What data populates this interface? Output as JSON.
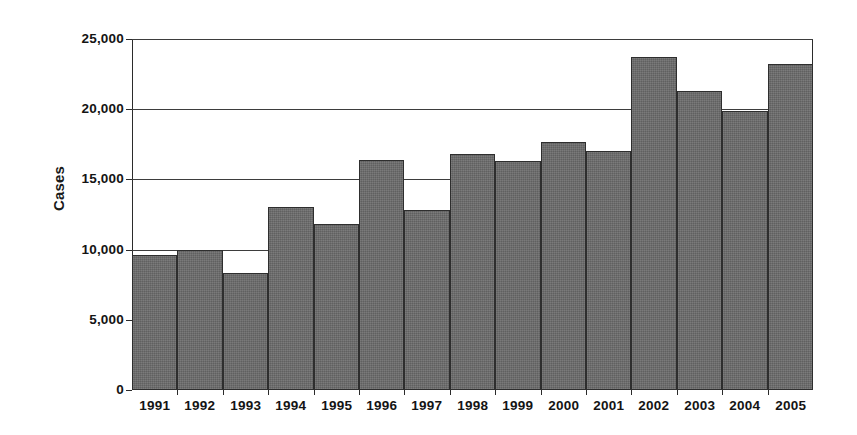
{
  "chart_data": {
    "type": "bar",
    "title": "",
    "subtitle": "",
    "xlabel": "",
    "ylabel": "Cases",
    "categories": [
      "1991",
      "1992",
      "1993",
      "1994",
      "1995",
      "1996",
      "1997",
      "1998",
      "1999",
      "2000",
      "2001",
      "2002",
      "2003",
      "2004",
      "2005"
    ],
    "values": [
      9600,
      10000,
      8300,
      13000,
      11800,
      16400,
      12850,
      16800,
      16300,
      17700,
      17000,
      23750,
      21300,
      19900,
      23250
    ],
    "series": [
      {
        "name": "Cases",
        "values": [
          9600,
          10000,
          8300,
          13000,
          11800,
          16400,
          12850,
          16800,
          16300,
          17700,
          17000,
          23750,
          21300,
          19900,
          23250
        ]
      }
    ],
    "ylim": [
      0,
      25000
    ],
    "yticks": [
      0,
      5000,
      10000,
      15000,
      20000,
      25000
    ],
    "ytick_labels": [
      "0",
      "5,000",
      "10,000",
      "15,000",
      "20,000",
      "25,000"
    ],
    "gridlines_at": [
      10000,
      15000,
      20000,
      25000
    ],
    "grid": true,
    "legend": "none",
    "bar_color": "#6b6b6b",
    "bar_border_color": "#2e2e2e",
    "axis_color": "#2b2b2b",
    "text_color": "#141414",
    "background": "#ffffff"
  },
  "axes": {
    "y_title": "Cases",
    "y_ticks": [
      {
        "label": "25,000",
        "value": 25000,
        "gridline": true
      },
      {
        "label": "20,000",
        "value": 20000,
        "gridline": true
      },
      {
        "label": "15,000",
        "value": 15000,
        "gridline": true
      },
      {
        "label": "10,000",
        "value": 10000,
        "gridline": true
      },
      {
        "label": "5,000",
        "value": 5000,
        "gridline": false
      },
      {
        "label": "0",
        "value": 0,
        "gridline": false
      }
    ]
  }
}
